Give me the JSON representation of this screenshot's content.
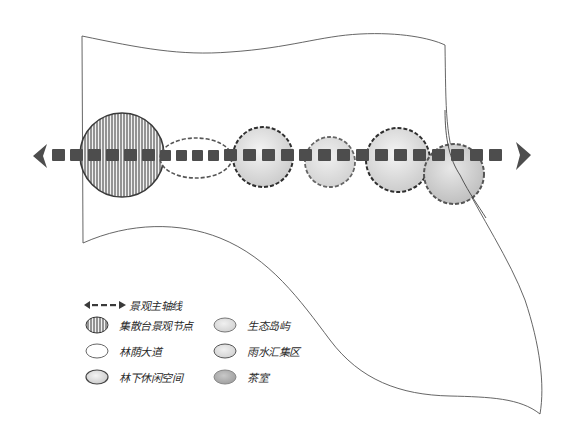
{
  "diagram": {
    "type": "landscape-concept-sketch",
    "axis": {
      "label": "景观主轴线",
      "style": "dashed-double-arrow",
      "color": "#4a4a4a"
    },
    "site_boundary": {
      "color": "#555555"
    },
    "nodes": [
      {
        "id": "n1",
        "type": "集散台景观节点",
        "shape": "circle",
        "fill": "hatched",
        "border": "solid"
      },
      {
        "id": "n2",
        "type": "林荫大道",
        "shape": "ellipse",
        "fill": "#ffffff",
        "border": "dashed"
      },
      {
        "id": "n3",
        "type": "林下休闲空间",
        "shape": "circle",
        "fill": "#d9d9d9",
        "border": "dashed-dark"
      },
      {
        "id": "n4",
        "type": "生态岛屿",
        "shape": "circle",
        "fill": "#e2e2e2",
        "border": "dashed"
      },
      {
        "id": "n5",
        "type": "雨水汇集区",
        "shape": "circle",
        "fill": "#d4d4d4",
        "border": "dashed-dark"
      },
      {
        "id": "n6",
        "type": "茶室",
        "shape": "circle",
        "fill": "#c8c8c8",
        "border": "dashed"
      }
    ]
  },
  "legend": {
    "axis_label": "景观主轴线",
    "items": [
      {
        "label": "集散台景观节点",
        "swatch": "hatched"
      },
      {
        "label": "林荫大道",
        "swatch": "white"
      },
      {
        "label": "林下休闲空间",
        "swatch": "light-grey"
      },
      {
        "label": "生态岛屿",
        "swatch": "pale-grey"
      },
      {
        "label": "雨水汇集区",
        "swatch": "pale-grey-2"
      },
      {
        "label": "茶室",
        "swatch": "mid-grey"
      }
    ]
  },
  "colors": {
    "ink": "#3a3a3a",
    "axis": "#4d4d4d",
    "hatch": "#5a5a5a",
    "paper": "#ffffff"
  }
}
